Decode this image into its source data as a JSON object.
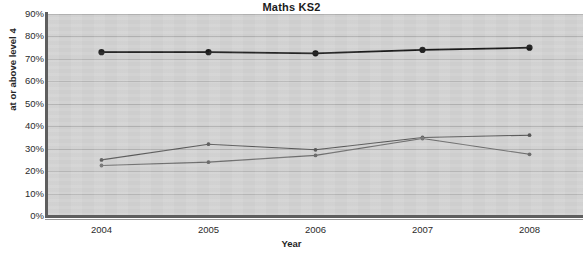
{
  "chart_data": {
    "type": "line",
    "title": "Maths KS2",
    "xlabel": "Year",
    "ylabel": "at or above level 4",
    "categories": [
      "2004",
      "2005",
      "2006",
      "2007",
      "2008"
    ],
    "x": [
      2004,
      2005,
      2006,
      2007,
      2008
    ],
    "ylim": [
      0,
      90
    ],
    "ytick_labels": [
      "0%",
      "10%",
      "20%",
      "30%",
      "40%",
      "50%",
      "60%",
      "70%",
      "80%",
      "90%"
    ],
    "ytick_values": [
      0,
      10,
      20,
      30,
      40,
      50,
      60,
      70,
      80,
      90
    ],
    "grid": true,
    "legend": "none",
    "plot_background": "#d2d2d2",
    "series": [
      {
        "name": "series-1",
        "color": "#1a1a1a",
        "marker": "circle",
        "marker_size": "large",
        "values": [
          73,
          73,
          72.5,
          74,
          75
        ]
      },
      {
        "name": "series-2",
        "color": "#585858",
        "marker": "circle",
        "marker_size": "small",
        "values": [
          25,
          32,
          29.5,
          35,
          36
        ]
      },
      {
        "name": "series-3",
        "color": "#6e6e6e",
        "marker": "circle",
        "marker_size": "small",
        "values": [
          22.5,
          24,
          27,
          34.5,
          27.5
        ]
      }
    ]
  }
}
